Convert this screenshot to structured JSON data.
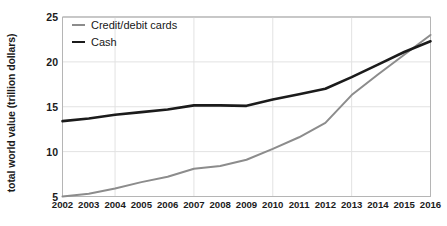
{
  "chart_data": {
    "type": "line",
    "title": "",
    "xlabel": "",
    "ylabel": "total world value (trillion dollars)",
    "x": [
      2002,
      2003,
      2004,
      2005,
      2006,
      2007,
      2008,
      2009,
      2010,
      2011,
      2012,
      2013,
      2014,
      2015,
      2016
    ],
    "categories": [
      "2002",
      "2003",
      "2004",
      "2005",
      "2006",
      "2007",
      "2008",
      "2009",
      "2010",
      "2011",
      "2012",
      "2013",
      "2014",
      "2015",
      "2016"
    ],
    "xlim": [
      2002,
      2016
    ],
    "ylim": [
      5,
      25
    ],
    "yticks": [
      5,
      10,
      15,
      20,
      25
    ],
    "ytick_labels": [
      "5",
      "10",
      "15",
      "20",
      "25"
    ],
    "grid": true,
    "legend_position": "top-left",
    "series": [
      {
        "name": "Credit/debit cards",
        "color": "#8c8c8c",
        "values": [
          5.0,
          5.3,
          5.9,
          6.6,
          7.2,
          8.1,
          8.4,
          9.1,
          10.3,
          11.6,
          13.2,
          16.3,
          18.6,
          20.8,
          23.0
        ]
      },
      {
        "name": "Cash",
        "color": "#1b1b1b",
        "values": [
          13.4,
          13.7,
          14.1,
          14.4,
          14.7,
          15.15,
          15.15,
          15.1,
          15.8,
          16.4,
          17.0,
          18.3,
          19.7,
          21.1,
          22.3
        ]
      }
    ]
  },
  "legend": {
    "items": [
      {
        "label": "Credit/debit cards"
      },
      {
        "label": "Cash"
      }
    ]
  },
  "axis": {
    "y_title": "total world value (trillion dollars)"
  },
  "colors": {
    "cards_line": "#8c8c8c",
    "cash_line": "#1b1b1b",
    "gridline": "#e2e2e2",
    "axis_line": "#b5b5b5",
    "text": "#1b1b1b",
    "background": "#ffffff"
  }
}
